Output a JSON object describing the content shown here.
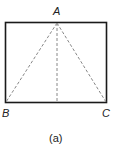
{
  "figure": {
    "caption": "(a)",
    "vertices": {
      "A": "A",
      "B": "B",
      "C": "C"
    },
    "shape": "rectangle",
    "lines": [
      "A-B dashed",
      "A-C dashed",
      "A-midpoint(BC) dashed"
    ]
  }
}
